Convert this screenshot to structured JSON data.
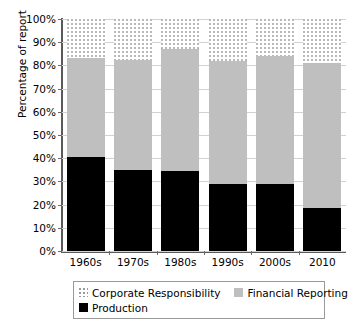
{
  "chart_data": {
    "type": "bar",
    "subtype": "stacked-bar-100",
    "title": "",
    "xlabel": "",
    "ylabel": "Percentage of report",
    "categories": [
      "1960s",
      "1970s",
      "1980s",
      "1990s",
      "2000s",
      "2010"
    ],
    "series": [
      {
        "name": "Production",
        "color": "#000000",
        "pattern": "solid-black",
        "values": [
          40.5,
          35.0,
          34.5,
          29.0,
          29.0,
          18.5
        ]
      },
      {
        "name": "Financial Reporting",
        "color": "#bfbfbf",
        "pattern": "solid-gray",
        "values": [
          42.5,
          47.5,
          52.5,
          53.0,
          55.0,
          62.5
        ]
      },
      {
        "name": "Corporate Responsibility",
        "color": "#ffffff",
        "pattern": "dotted",
        "values": [
          17.0,
          17.5,
          13.0,
          18.0,
          16.0,
          19.0
        ]
      }
    ],
    "cumulative_tops": {
      "production": [
        40.5,
        35.0,
        34.5,
        29.0,
        29.0,
        18.5
      ],
      "production_plus_financial": [
        83.0,
        82.5,
        87.0,
        82.0,
        84.0,
        81.0
      ],
      "total": [
        100,
        100,
        100,
        100,
        100,
        100
      ]
    },
    "ylim": [
      0,
      100
    ],
    "ytick_labels": [
      "0%",
      "10%",
      "20%",
      "30%",
      "40%",
      "50%",
      "60%",
      "70%",
      "80%",
      "90%",
      "100%"
    ],
    "ytick_values": [
      0,
      10,
      20,
      30,
      40,
      50,
      60,
      70,
      80,
      90,
      100
    ],
    "grid": true,
    "legend_position": "bottom",
    "legend_entries": [
      {
        "label": "Corporate Responsibility",
        "swatch": "dotted"
      },
      {
        "label": "Financial Reporting",
        "swatch": "gray"
      },
      {
        "label": "Production",
        "swatch": "black"
      }
    ]
  }
}
